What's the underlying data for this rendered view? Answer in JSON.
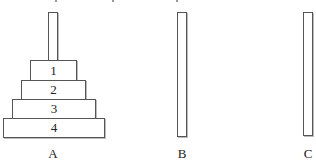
{
  "diagram": {
    "pegs": [
      {
        "id": "A",
        "label": "A"
      },
      {
        "id": "B",
        "label": "B"
      },
      {
        "id": "C",
        "label": "C"
      }
    ],
    "discs": [
      {
        "label": "1",
        "peg": "A"
      },
      {
        "label": "2",
        "peg": "A"
      },
      {
        "label": "3",
        "peg": "A"
      },
      {
        "label": "4",
        "peg": "A"
      }
    ],
    "colors": {
      "stroke": "#555555",
      "fill": "#ffffff",
      "text": "#222222"
    }
  }
}
